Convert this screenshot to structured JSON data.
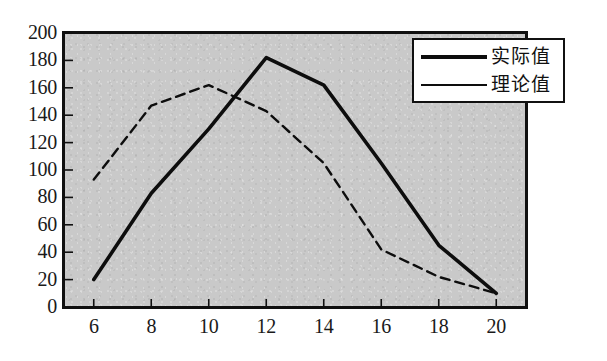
{
  "chart_data": {
    "type": "line",
    "title": "",
    "xlabel": "",
    "ylabel": "",
    "xlim": [
      5,
      21
    ],
    "ylim": [
      0,
      200
    ],
    "grid": false,
    "legend_position": "top-right",
    "x": [
      6,
      8,
      10,
      12,
      14,
      16,
      18,
      20
    ],
    "x_ticks": [
      "6",
      "8",
      "10",
      "12",
      "14",
      "16",
      "18",
      "20"
    ],
    "y_ticks": [
      "0",
      "20",
      "40",
      "60",
      "80",
      "100",
      "120",
      "140",
      "160",
      "180",
      "200"
    ],
    "series": [
      {
        "name": "实际值",
        "style": "solid",
        "width": "thick",
        "color": "#0d0d0d",
        "values": [
          20,
          83,
          130,
          182,
          162,
          105,
          45,
          10
        ]
      },
      {
        "name": "理论值",
        "style": "dashed",
        "width": "thin",
        "color": "#0d0d0d",
        "values": [
          93,
          147,
          162,
          143,
          105,
          42,
          22,
          10
        ]
      }
    ]
  },
  "legend": {
    "items": [
      {
        "label": "实际值",
        "swatch": "thick-solid-line"
      },
      {
        "label": "理论值",
        "swatch": "thin-solid-line"
      }
    ]
  },
  "colors": {
    "plot_background": "#c9c9c9",
    "axis": "#101010",
    "series_line": "#0d0d0d",
    "legend_background": "#ffffff",
    "page_background": "#ffffff"
  }
}
